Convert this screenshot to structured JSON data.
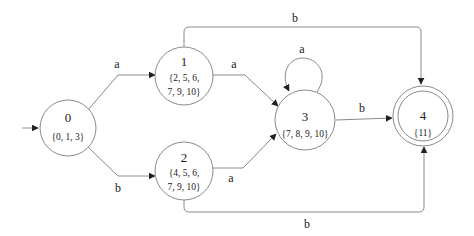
{
  "diagram": {
    "type": "DFA state diagram (subset construction)",
    "initial_state": "0",
    "states": [
      {
        "id": "0",
        "set_lines": [
          "{0, 1, 3}"
        ],
        "accepting": false
      },
      {
        "id": "1",
        "set_lines": [
          "{2, 5, 6,",
          "7, 9, 10}"
        ],
        "accepting": false
      },
      {
        "id": "2",
        "set_lines": [
          "{4, 5, 6,",
          "7, 9, 10}"
        ],
        "accepting": false
      },
      {
        "id": "3",
        "set_lines": [
          "{7, 8, 9, 10}"
        ],
        "accepting": false
      },
      {
        "id": "4",
        "set_lines": [
          "{11}"
        ],
        "accepting": true
      }
    ],
    "transitions": [
      {
        "from": "0",
        "to": "1",
        "label": "a"
      },
      {
        "from": "0",
        "to": "2",
        "label": "b"
      },
      {
        "from": "1",
        "to": "3",
        "label": "a"
      },
      {
        "from": "2",
        "to": "3",
        "label": "a"
      },
      {
        "from": "3",
        "to": "3",
        "label": "a"
      },
      {
        "from": "3",
        "to": "4",
        "label": "b"
      },
      {
        "from": "1",
        "to": "4",
        "label": "b"
      },
      {
        "from": "2",
        "to": "4",
        "label": "b"
      }
    ],
    "colors": {
      "stroke": "#8a8a8a",
      "text": "#222222",
      "background": "#ffffff"
    }
  }
}
